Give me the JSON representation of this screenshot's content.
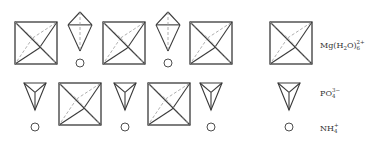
{
  "diagram": {
    "row1": [
      {
        "type": "octahedron",
        "x": 15,
        "y": 22,
        "size": 42
      },
      {
        "type": "tetra-up",
        "cx": 80,
        "top": 12,
        "bottom": 51
      },
      {
        "type": "ion",
        "cx": 80,
        "cy": 63
      },
      {
        "type": "octahedron",
        "x": 103,
        "y": 22,
        "size": 42
      },
      {
        "type": "tetra-up",
        "cx": 168,
        "top": 12,
        "bottom": 51
      },
      {
        "type": "ion",
        "cx": 168,
        "cy": 63
      },
      {
        "type": "octahedron",
        "x": 190,
        "y": 22,
        "size": 42
      }
    ],
    "row2": [
      {
        "type": "tetra-down",
        "cx": 35,
        "top": 83,
        "bottom": 110
      },
      {
        "type": "ion",
        "cx": 35,
        "cy": 127
      },
      {
        "type": "octahedron",
        "x": 59,
        "y": 83,
        "size": 42
      },
      {
        "type": "tetra-down",
        "cx": 125,
        "top": 83,
        "bottom": 110
      },
      {
        "type": "ion",
        "cx": 125,
        "cy": 127
      },
      {
        "type": "octahedron",
        "x": 148,
        "y": 83,
        "size": 42
      },
      {
        "type": "tetra-down",
        "cx": 211,
        "top": 83,
        "bottom": 110
      },
      {
        "type": "ion",
        "cx": 211,
        "cy": 127
      }
    ]
  },
  "legend": {
    "items": [
      {
        "symbol": "octahedron",
        "label_main": "Mg(H",
        "label_sub1": "2",
        "label_mid": "O)",
        "label_sub2": "6",
        "label_sup": "2+"
      },
      {
        "symbol": "tetrahedron",
        "label_main": "PO",
        "label_sub": "4",
        "label_sup": "3−"
      },
      {
        "symbol": "ion",
        "label_main": "NH",
        "label_sub": "4",
        "label_sup": "+"
      }
    ]
  },
  "colors": {
    "stroke": "#3a3a3a",
    "dashed": "#9a9a9a",
    "text": "#333333"
  }
}
